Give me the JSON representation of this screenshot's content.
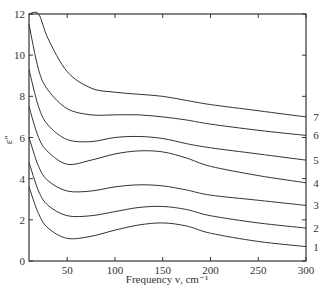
{
  "chart_data": {
    "type": "line",
    "title": "",
    "xlabel": "Frequency ν, cm⁻¹",
    "ylabel": "ε''",
    "xlim": [
      10,
      300
    ],
    "ylim": [
      0,
      12
    ],
    "xticks": [
      50,
      100,
      150,
      200,
      250,
      300
    ],
    "yticks": [
      0,
      2,
      4,
      6,
      8,
      10,
      12
    ],
    "grid": false,
    "legend": "curve labels 1–7 on right edge",
    "x": [
      10,
      20,
      30,
      50,
      75,
      100,
      125,
      150,
      175,
      200,
      250,
      300
    ],
    "series": [
      {
        "name": "1",
        "values": [
          3.6,
          2.3,
          1.6,
          1.1,
          1.2,
          1.5,
          1.75,
          1.85,
          1.7,
          1.35,
          0.95,
          0.7
        ]
      },
      {
        "name": "2",
        "values": [
          4.8,
          3.4,
          2.7,
          2.2,
          2.2,
          2.4,
          2.6,
          2.65,
          2.5,
          2.2,
          1.85,
          1.6
        ]
      },
      {
        "name": "3",
        "values": [
          6.0,
          4.6,
          3.9,
          3.4,
          3.4,
          3.6,
          3.7,
          3.65,
          3.45,
          3.2,
          2.95,
          2.7
        ]
      },
      {
        "name": "4",
        "values": [
          7.5,
          6.0,
          5.3,
          4.7,
          4.9,
          5.2,
          5.35,
          5.3,
          5.0,
          4.6,
          4.15,
          3.8
        ]
      },
      {
        "name": "5",
        "values": [
          9.3,
          7.5,
          6.6,
          5.9,
          5.8,
          6.0,
          6.05,
          5.95,
          5.7,
          5.5,
          5.2,
          4.9
        ]
      },
      {
        "name": "6",
        "values": [
          11.5,
          9.3,
          8.3,
          7.4,
          7.1,
          7.1,
          7.1,
          7.0,
          6.85,
          6.65,
          6.35,
          6.1
        ]
      },
      {
        "name": "7",
        "values": [
          12.0,
          12.0,
          10.8,
          9.2,
          8.4,
          8.2,
          8.1,
          8.0,
          7.8,
          7.6,
          7.3,
          7.0
        ]
      }
    ]
  }
}
